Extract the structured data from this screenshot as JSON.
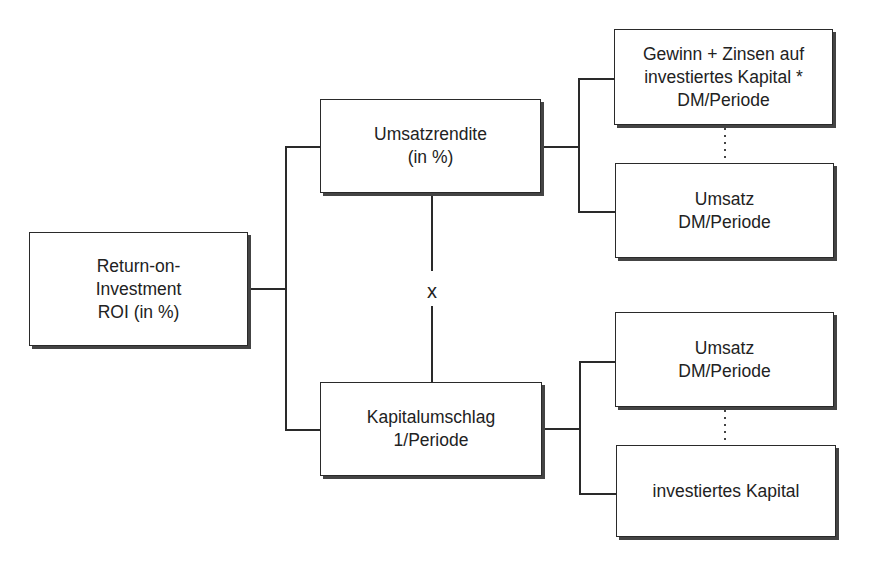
{
  "diagram": {
    "type": "tree",
    "root": {
      "id": "roi",
      "lines": [
        "Return-on-",
        "Investment",
        "ROI (in %)"
      ]
    },
    "level1": [
      {
        "id": "umsatzrendite",
        "lines": [
          "Umsatzrendite",
          "(in %)"
        ],
        "children": [
          {
            "id": "gewinn-zinsen",
            "lines": [
              "Gewinn + Zinsen auf",
              "investiertes Kapital *",
              "DM/Periode"
            ]
          },
          {
            "id": "umsatz-1",
            "lines": [
              "Umsatz",
              "DM/Periode"
            ]
          }
        ],
        "child_operator": "÷ (dotted line)"
      },
      {
        "id": "kapitalumschlag",
        "lines": [
          "Kapitalumschlag",
          "1/Periode"
        ],
        "children": [
          {
            "id": "umsatz-2",
            "lines": [
              "Umsatz",
              "DM/Periode"
            ]
          },
          {
            "id": "investiertes-kapital",
            "lines": [
              "investiertes Kapital"
            ]
          }
        ],
        "child_operator": "÷ (dotted line)"
      }
    ],
    "operator_between_level1": "x",
    "colors": {
      "line": "#2a2a2a",
      "shadow": "#444444",
      "background": "#ffffff"
    }
  }
}
